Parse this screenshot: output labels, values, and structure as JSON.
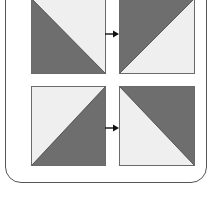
{
  "diagram": {
    "title": "",
    "colors": {
      "dark": "#6e6e6e",
      "light": "#efefef",
      "border": "#6a6a6a",
      "arrow": "#111111",
      "frame": "#555555"
    },
    "rows": [
      {
        "from": {
          "dark_corner": "bottom-left",
          "diagonal": "top-left-to-bottom-right"
        },
        "to": {
          "dark_corner": "top-left",
          "diagonal": "bottom-left-to-top-right"
        }
      },
      {
        "from": {
          "dark_corner": "bottom-right",
          "diagonal": "bottom-left-to-top-right"
        },
        "to": {
          "dark_corner": "top-right",
          "diagonal": "top-left-to-bottom-right"
        }
      }
    ],
    "arrow_icon": "arrow-right-icon"
  }
}
